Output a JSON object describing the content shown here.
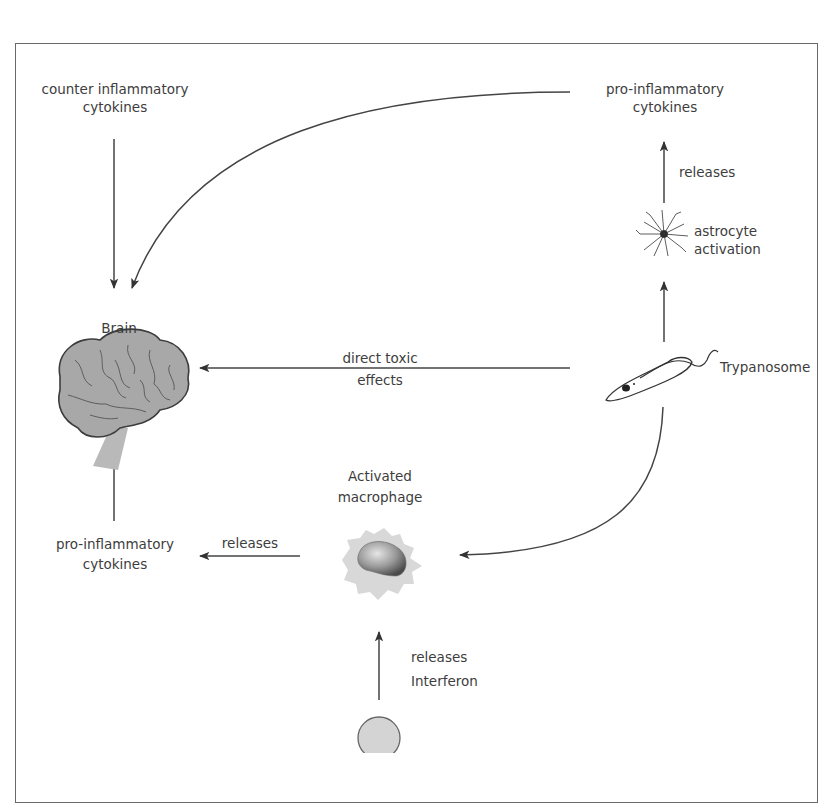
{
  "figure": {
    "title_partial": "Trypanosoma brucei infection and the neuroinflammatory cycle",
    "nodes": {
      "counter_cytokines": {
        "line1": "counter inflammatory",
        "line2": "cytokines"
      },
      "pro_cytokines_top": {
        "line1": "pro-inflammatory",
        "line2": "cytokines"
      },
      "astrocyte": {
        "line1": "astrocyte",
        "line2": "activation"
      },
      "brain": {
        "label": "Brain"
      },
      "trypanosome": {
        "label": "Trypanosome"
      },
      "macrophage": {
        "line1": "Activated",
        "line2": "macrophage"
      },
      "pro_cytokines_bottom": {
        "line1": "pro-inflammatory",
        "line2": "cytokines"
      }
    },
    "edges": {
      "astrocyte_releases": "releases",
      "toxic_line1": "direct toxic",
      "toxic_line2": "effects",
      "macrophage_releases": "releases",
      "interferon_line1": "releases",
      "interferon_line2": "Interferon"
    },
    "colors": {
      "frame": "#6a6a6a",
      "arrow": "#3a3a3a",
      "brain_fill": "#a8a8a8",
      "brain_stroke": "#3c3c3c",
      "macrophage_fill": "#d8d8d8",
      "nucleus_fill": "#8c8c8c",
      "cell_fill": "#d4d4d4"
    }
  }
}
